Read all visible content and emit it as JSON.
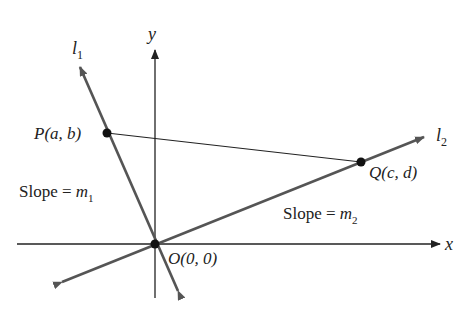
{
  "diagram": {
    "axes": {
      "x_label": "x",
      "y_label": "y"
    },
    "lines": [
      {
        "name": "l",
        "sub": "1",
        "slope_label": "Slope = ",
        "slope_var": "m",
        "slope_sub": "1"
      },
      {
        "name": "l",
        "sub": "2",
        "slope_label": "Slope = ",
        "slope_var": "m",
        "slope_sub": "2"
      }
    ],
    "points": {
      "P": {
        "label": "P(a, b)"
      },
      "Q": {
        "label": "Q(c, d)"
      },
      "O": {
        "label": "O(0, 0)"
      }
    },
    "colors": {
      "axis": "#222222",
      "line": "#555555",
      "point": "#111111"
    }
  }
}
